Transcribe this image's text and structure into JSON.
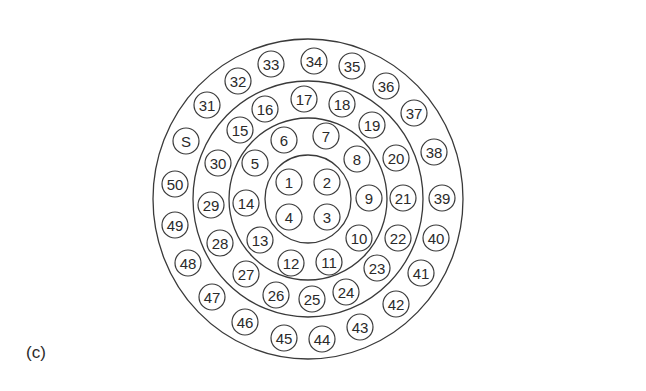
{
  "figure": {
    "panel_label": "(c)",
    "center": [
      308,
      199
    ],
    "line_color": "#3a3a3a",
    "node_radius": 13,
    "rings": [
      {
        "name": "ring-1",
        "rx": 43,
        "ry": 44
      },
      {
        "name": "ring-2",
        "rx": 79,
        "ry": 81
      },
      {
        "name": "ring-3",
        "rx": 115,
        "ry": 118
      },
      {
        "name": "ring-outer",
        "rx": 155,
        "ry": 160
      }
    ],
    "nodes": [
      {
        "label": "1",
        "x": 289,
        "y": 182
      },
      {
        "label": "2",
        "x": 327,
        "y": 182
      },
      {
        "label": "3",
        "x": 327,
        "y": 217
      },
      {
        "label": "4",
        "x": 289,
        "y": 217
      },
      {
        "label": "5",
        "x": 255,
        "y": 163
      },
      {
        "label": "6",
        "x": 284,
        "y": 140
      },
      {
        "label": "7",
        "x": 326,
        "y": 136
      },
      {
        "label": "8",
        "x": 357,
        "y": 159
      },
      {
        "label": "9",
        "x": 369,
        "y": 198
      },
      {
        "label": "10",
        "x": 359,
        "y": 238
      },
      {
        "label": "11",
        "x": 329,
        "y": 262
      },
      {
        "label": "12",
        "x": 291,
        "y": 263
      },
      {
        "label": "13",
        "x": 260,
        "y": 240
      },
      {
        "label": "14",
        "x": 246,
        "y": 203
      },
      {
        "label": "15",
        "x": 240,
        "y": 130
      },
      {
        "label": "16",
        "x": 265,
        "y": 109
      },
      {
        "label": "17",
        "x": 304,
        "y": 99
      },
      {
        "label": "18",
        "x": 342,
        "y": 104
      },
      {
        "label": "19",
        "x": 372,
        "y": 125
      },
      {
        "label": "20",
        "x": 396,
        "y": 158
      },
      {
        "label": "21",
        "x": 403,
        "y": 198
      },
      {
        "label": "22",
        "x": 398,
        "y": 238
      },
      {
        "label": "23",
        "x": 377,
        "y": 268
      },
      {
        "label": "24",
        "x": 346,
        "y": 292
      },
      {
        "label": "25",
        "x": 312,
        "y": 299
      },
      {
        "label": "26",
        "x": 276,
        "y": 295
      },
      {
        "label": "27",
        "x": 246,
        "y": 274
      },
      {
        "label": "28",
        "x": 220,
        "y": 243
      },
      {
        "label": "29",
        "x": 211,
        "y": 205
      },
      {
        "label": "30",
        "x": 218,
        "y": 163
      },
      {
        "label": "31",
        "x": 207,
        "y": 105
      },
      {
        "label": "32",
        "x": 238,
        "y": 81
      },
      {
        "label": "33",
        "x": 271,
        "y": 64
      },
      {
        "label": "34",
        "x": 314,
        "y": 61
      },
      {
        "label": "35",
        "x": 352,
        "y": 66
      },
      {
        "label": "36",
        "x": 386,
        "y": 86
      },
      {
        "label": "37",
        "x": 414,
        "y": 113
      },
      {
        "label": "38",
        "x": 434,
        "y": 152
      },
      {
        "label": "39",
        "x": 442,
        "y": 198
      },
      {
        "label": "40",
        "x": 436,
        "y": 238
      },
      {
        "label": "41",
        "x": 421,
        "y": 273
      },
      {
        "label": "42",
        "x": 396,
        "y": 304
      },
      {
        "label": "43",
        "x": 360,
        "y": 327
      },
      {
        "label": "44",
        "x": 322,
        "y": 339
      },
      {
        "label": "45",
        "x": 284,
        "y": 338
      },
      {
        "label": "46",
        "x": 245,
        "y": 322
      },
      {
        "label": "47",
        "x": 212,
        "y": 297
      },
      {
        "label": "48",
        "x": 188,
        "y": 263
      },
      {
        "label": "49",
        "x": 175,
        "y": 225
      },
      {
        "label": "50",
        "x": 175,
        "y": 184
      },
      {
        "label": "S",
        "x": 186,
        "y": 141
      }
    ]
  }
}
